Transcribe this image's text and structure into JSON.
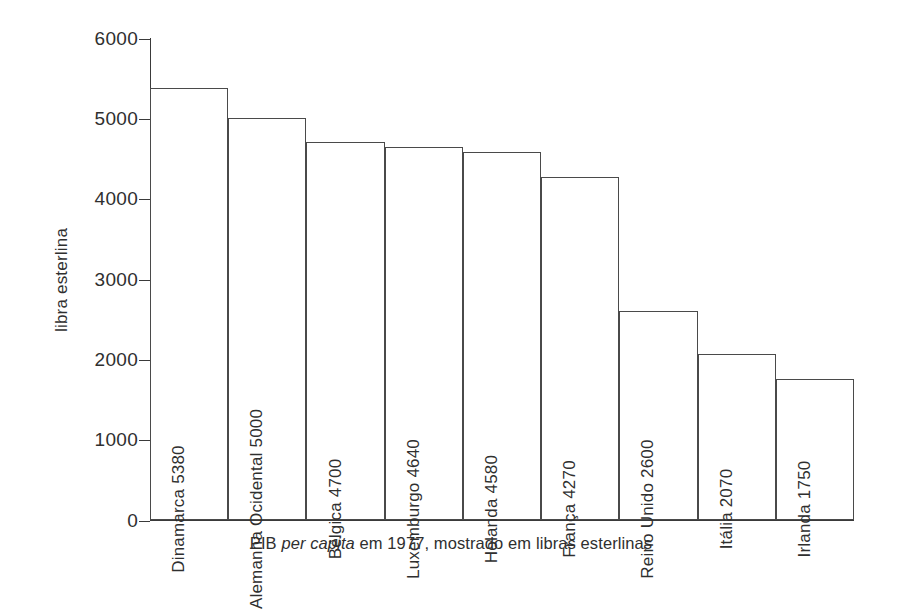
{
  "chart_data": {
    "type": "bar",
    "title": "",
    "caption_prefix": "PIB ",
    "caption_italic": "per capita",
    "caption_suffix": " em 1977, mostrado em libras esterlinas",
    "caption_full": "PIB per capita em 1977, mostrado em libras esterlinas",
    "xlabel": "",
    "ylabel": "libra esterlina",
    "ylim": [
      0,
      6000
    ],
    "ytick_values": [
      6000,
      5000,
      4000,
      3000,
      2000,
      1000,
      0
    ],
    "ytick_labels": [
      "6000",
      "5000",
      "4000",
      "3000",
      "2000",
      "1000",
      "0"
    ],
    "grid": false,
    "legend": "none",
    "bar_style": "outline",
    "bar_fill_color": "#ffffff",
    "bar_border_color": "#4a4a4a",
    "axis_color": "#3a3a3a",
    "text_color": "#2f2f2f",
    "background_color": "#ffffff",
    "categories": [
      "Dinamarca",
      "Alemanha Ocidental",
      "Bélgica",
      "Luxemburgo",
      "Holanda",
      "França",
      "Reino Unido",
      "Itália",
      "Irlanda"
    ],
    "values": [
      5380,
      5000,
      4700,
      4640,
      4580,
      4270,
      2600,
      2070,
      1750
    ],
    "bar_labels": [
      "Dinamarca 5380",
      "Alemanha Ocidental 5000",
      "Bélgica 4700",
      "Luxemburgo 4640",
      "Holanda 4580",
      "França 4270",
      "Reino Unido 2600",
      "Itália 2070",
      "Irlanda 1750"
    ]
  }
}
